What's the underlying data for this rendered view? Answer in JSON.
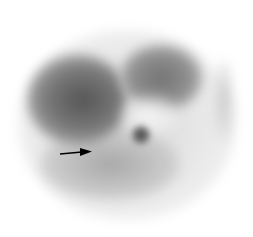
{
  "image": {
    "type": "grayscale scintigraphy scan",
    "background": "#ffffff",
    "annotation": {
      "type": "arrow",
      "direction": "right",
      "color": "#000000",
      "from": [
        60,
        154
      ],
      "to": [
        91,
        151
      ]
    },
    "regions": [
      {
        "name": "body-outline",
        "x": 18,
        "y": 30,
        "w": 218,
        "h": 190,
        "color": "#f1f1f1"
      },
      {
        "name": "left-dense-region",
        "x": 28,
        "y": 55,
        "w": 100,
        "h": 90,
        "color": "#6e6e6e"
      },
      {
        "name": "right-dense-region",
        "x": 120,
        "y": 45,
        "w": 80,
        "h": 65,
        "color": "#8a8a8a"
      },
      {
        "name": "lower-region",
        "x": 40,
        "y": 130,
        "w": 140,
        "h": 70,
        "color": "#b5b5b5"
      },
      {
        "name": "focal-spot",
        "x": 132,
        "y": 126,
        "w": 18,
        "h": 18,
        "color": "#555555"
      }
    ]
  }
}
